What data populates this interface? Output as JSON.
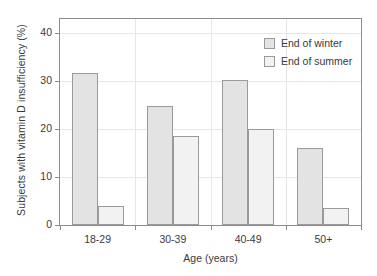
{
  "chart_data": {
    "type": "bar",
    "title": "",
    "xlabel": "Age (years)",
    "ylabel": "Subjects with vitamin D insufficiency (%)",
    "categories": [
      "18-29",
      "30-39",
      "40-49",
      "50+"
    ],
    "series": [
      {
        "name": "End of winter",
        "values": [
          31.7,
          24.9,
          30.3,
          16.1
        ],
        "color": "#e3e3e3"
      },
      {
        "name": "End of summer",
        "values": [
          4.0,
          18.5,
          20.0,
          3.6
        ],
        "color": "#f2f2f2"
      }
    ],
    "ylim": [
      0,
      43
    ],
    "yticks": [
      0,
      10,
      20,
      30,
      40
    ],
    "ytick_labels": [
      "0",
      "10",
      "20",
      "30",
      "40"
    ],
    "grid": true,
    "legend_position": "top-right",
    "bar_border_color": "#9a9a9a",
    "axis_color": "#8c8c8c",
    "grid_color": "#e6e6e6",
    "background": "#ffffff"
  },
  "legend": {
    "items": [
      {
        "label": "End of winter"
      },
      {
        "label": "End of summer"
      }
    ]
  }
}
